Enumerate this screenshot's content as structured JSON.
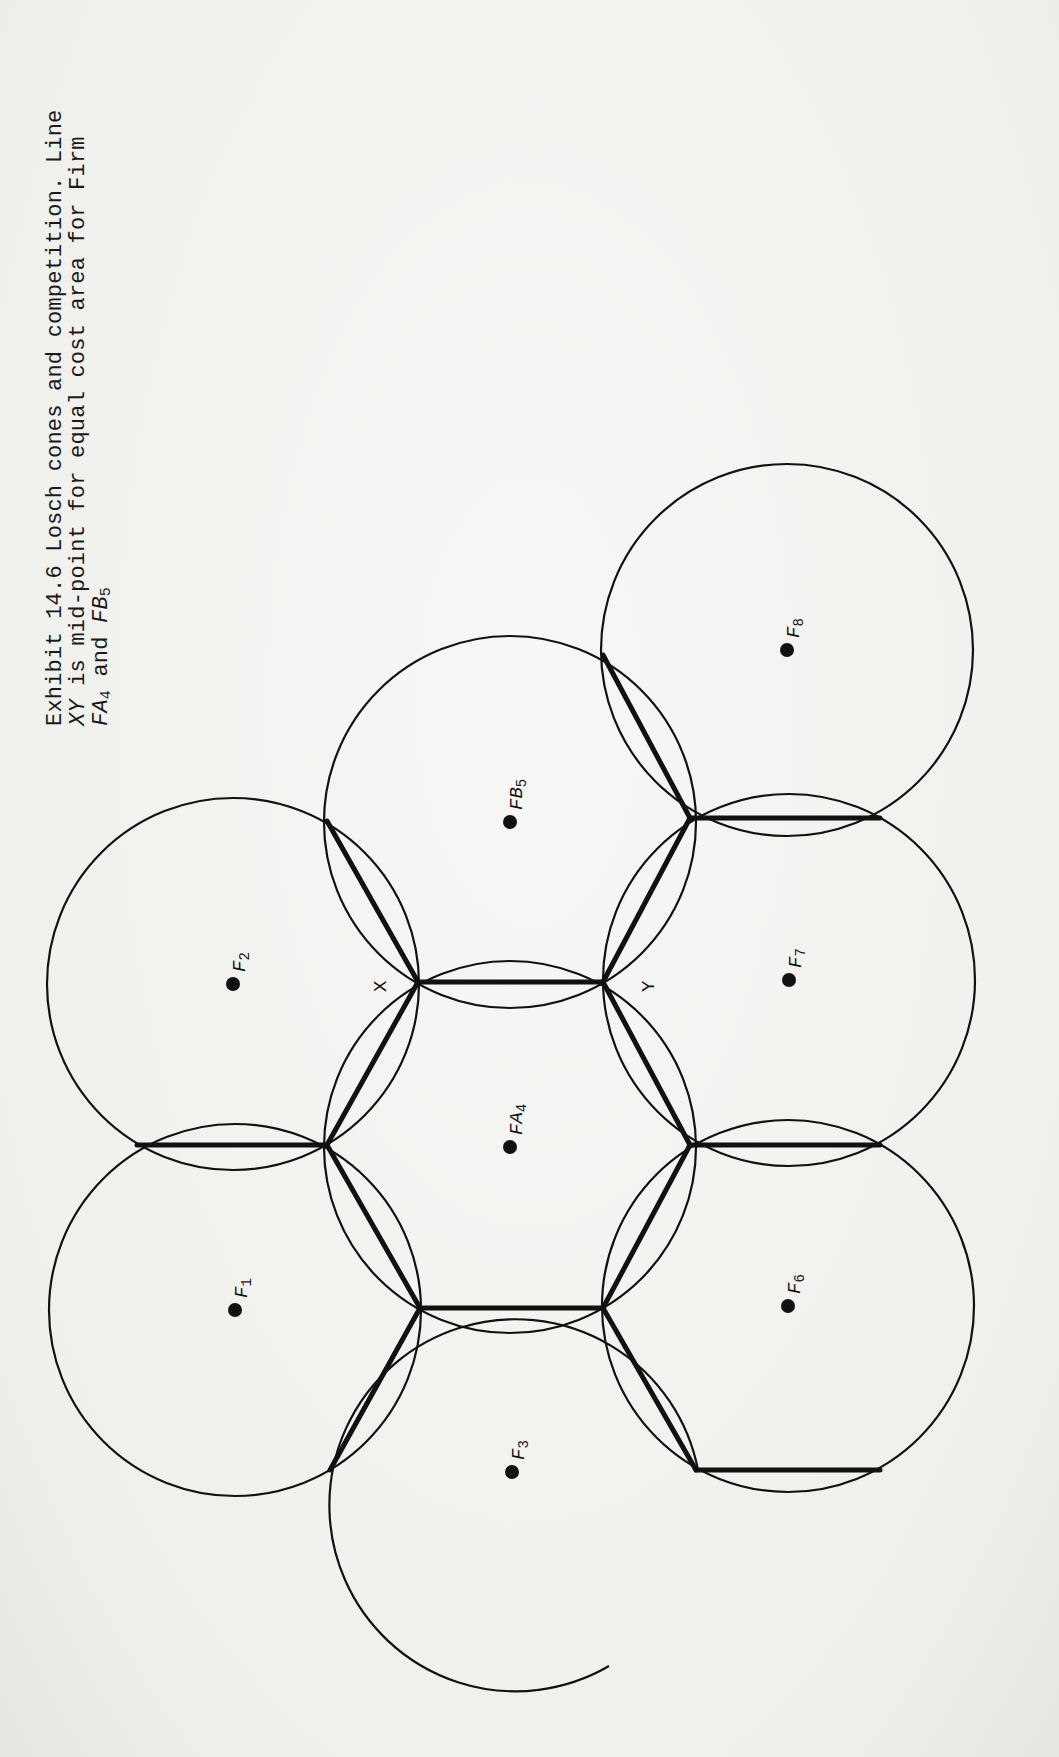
{
  "caption": {
    "line1": "Exhibit 14.6  Losch cones and competition. Line",
    "line2_prefix": "XY",
    "line2_rest": " is mid-point for equal cost area for Firm",
    "line3_a": "FA",
    "line3_a_sub": "4",
    "line3_mid": " and ",
    "line3_b": "FB",
    "line3_b_sub": "5"
  },
  "diagram": {
    "circle_radius": 186,
    "stroke_color": "#111111",
    "firms": [
      {
        "id": "F1",
        "name": "F",
        "sub": "1",
        "x": 235,
        "y": 1310
      },
      {
        "id": "F2",
        "name": "F",
        "sub": "2",
        "x": 233,
        "y": 984
      },
      {
        "id": "F3",
        "name": "F",
        "sub": "3",
        "x": 512,
        "y": 1472
      },
      {
        "id": "FA4",
        "name": "FA",
        "sub": "4",
        "x": 510,
        "y": 1147
      },
      {
        "id": "FB5",
        "name": "FB",
        "sub": "5",
        "x": 510,
        "y": 822
      },
      {
        "id": "F6",
        "name": "F",
        "sub": "6",
        "x": 788,
        "y": 1306
      },
      {
        "id": "F7",
        "name": "F",
        "sub": "7",
        "x": 789,
        "y": 980
      },
      {
        "id": "F8",
        "name": "F",
        "sub": "8",
        "x": 787,
        "y": 650
      }
    ],
    "points": {
      "X": {
        "label": "X",
        "x": 418,
        "y": 982
      },
      "Y": {
        "label": "Y",
        "x": 603,
        "y": 982
      }
    }
  }
}
